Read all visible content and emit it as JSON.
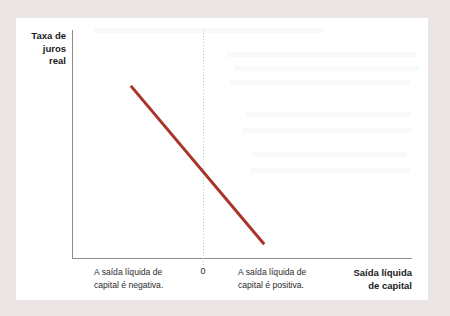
{
  "figure": {
    "background_color": "#ece5e5",
    "card_color": "#ffffff"
  },
  "axes": {
    "y_title": "Taxa de\njuros\nreal",
    "x_title": "Saída líquida\nde capital",
    "zero_tick_label": "0",
    "axis_color": "#8d8d8d",
    "gridline_color": "#bdc5cc"
  },
  "annotations": {
    "negative_region": "A saída líquida de\ncapital é negativa.",
    "positive_region": "A saída líquida de\ncapital é positiva."
  },
  "chart_data": {
    "type": "line",
    "title": "",
    "subtitle": "",
    "xlabel": "Saída líquida de capital",
    "ylabel": "Taxa de juros real",
    "grid": false,
    "legend_position": "none",
    "xlim": [
      -1,
      1.6
    ],
    "ylim": [
      0,
      1
    ],
    "xticks": [
      0
    ],
    "xticklabels": [
      "0"
    ],
    "yticks": [],
    "yticklabels": [],
    "series": [
      {
        "name": "Saída líquida de capital",
        "color": "#a8342a",
        "linewidth": 3,
        "x": [
          -0.55,
          0.0,
          0.47
        ],
        "y": [
          0.755,
          0.41,
          0.06
        ]
      }
    ],
    "annotations": [
      {
        "text": "A saída líquida de capital é negativa.",
        "x": -0.55,
        "y": -0.04,
        "region": "left-of-zero"
      },
      {
        "text": "A saída líquida de capital é positiva.",
        "x": 0.28,
        "y": -0.04,
        "region": "right-of-zero"
      }
    ],
    "reference_lines": [
      {
        "name": "zero-vertical",
        "orientation": "vertical",
        "value": 0,
        "style": "dotted",
        "color": "#bdc5cc"
      }
    ]
  }
}
